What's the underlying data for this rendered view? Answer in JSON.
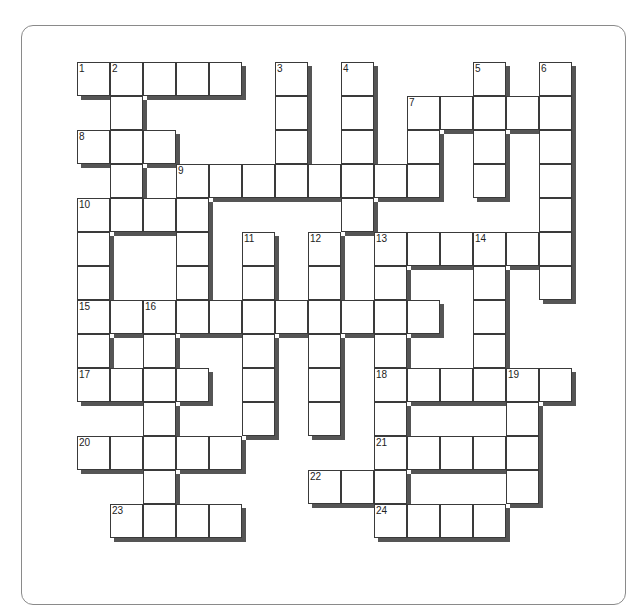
{
  "puzzle": {
    "type": "crossword",
    "cols": 15,
    "rows": 14,
    "origin_x": 77,
    "origin_y": 62,
    "cell_w": 33,
    "cell_h": 34,
    "cells": [
      [
        0,
        0,
        "1"
      ],
      [
        0,
        1,
        "2"
      ],
      [
        0,
        2,
        ""
      ],
      [
        0,
        3,
        ""
      ],
      [
        0,
        4,
        ""
      ],
      [
        0,
        6,
        "3"
      ],
      [
        0,
        8,
        "4"
      ],
      [
        0,
        12,
        "5"
      ],
      [
        0,
        14,
        "6"
      ],
      [
        1,
        1,
        ""
      ],
      [
        1,
        6,
        ""
      ],
      [
        1,
        8,
        ""
      ],
      [
        1,
        10,
        "7"
      ],
      [
        1,
        11,
        ""
      ],
      [
        1,
        12,
        ""
      ],
      [
        1,
        13,
        ""
      ],
      [
        1,
        14,
        ""
      ],
      [
        2,
        0,
        "8"
      ],
      [
        2,
        1,
        ""
      ],
      [
        2,
        2,
        ""
      ],
      [
        2,
        6,
        ""
      ],
      [
        2,
        8,
        ""
      ],
      [
        2,
        10,
        ""
      ],
      [
        2,
        12,
        ""
      ],
      [
        2,
        14,
        ""
      ],
      [
        3,
        1,
        ""
      ],
      [
        3,
        3,
        "9"
      ],
      [
        3,
        4,
        ""
      ],
      [
        3,
        5,
        ""
      ],
      [
        3,
        6,
        ""
      ],
      [
        3,
        7,
        ""
      ],
      [
        3,
        8,
        ""
      ],
      [
        3,
        9,
        ""
      ],
      [
        3,
        10,
        ""
      ],
      [
        3,
        12,
        ""
      ],
      [
        3,
        14,
        ""
      ],
      [
        4,
        0,
        "10"
      ],
      [
        4,
        1,
        ""
      ],
      [
        4,
        2,
        ""
      ],
      [
        4,
        3,
        ""
      ],
      [
        4,
        8,
        ""
      ],
      [
        4,
        14,
        ""
      ],
      [
        5,
        0,
        ""
      ],
      [
        5,
        3,
        ""
      ],
      [
        5,
        5,
        "11"
      ],
      [
        5,
        7,
        "12"
      ],
      [
        5,
        9,
        "13"
      ],
      [
        5,
        10,
        ""
      ],
      [
        5,
        11,
        ""
      ],
      [
        5,
        12,
        "14"
      ],
      [
        5,
        13,
        ""
      ],
      [
        5,
        14,
        ""
      ],
      [
        6,
        0,
        ""
      ],
      [
        6,
        3,
        ""
      ],
      [
        6,
        5,
        ""
      ],
      [
        6,
        7,
        ""
      ],
      [
        6,
        9,
        ""
      ],
      [
        6,
        12,
        ""
      ],
      [
        6,
        14,
        ""
      ],
      [
        7,
        0,
        "15"
      ],
      [
        7,
        1,
        ""
      ],
      [
        7,
        2,
        "16"
      ],
      [
        7,
        3,
        ""
      ],
      [
        7,
        4,
        ""
      ],
      [
        7,
        5,
        ""
      ],
      [
        7,
        6,
        ""
      ],
      [
        7,
        7,
        ""
      ],
      [
        7,
        8,
        ""
      ],
      [
        7,
        9,
        ""
      ],
      [
        7,
        10,
        ""
      ],
      [
        7,
        12,
        ""
      ],
      [
        8,
        0,
        ""
      ],
      [
        8,
        2,
        ""
      ],
      [
        8,
        5,
        ""
      ],
      [
        8,
        7,
        ""
      ],
      [
        8,
        9,
        ""
      ],
      [
        8,
        12,
        ""
      ],
      [
        9,
        0,
        "17"
      ],
      [
        9,
        1,
        ""
      ],
      [
        9,
        2,
        ""
      ],
      [
        9,
        3,
        ""
      ],
      [
        9,
        5,
        ""
      ],
      [
        9,
        7,
        ""
      ],
      [
        9,
        9,
        "18"
      ],
      [
        9,
        10,
        ""
      ],
      [
        9,
        11,
        ""
      ],
      [
        9,
        12,
        ""
      ],
      [
        9,
        13,
        "19"
      ],
      [
        9,
        14,
        ""
      ],
      [
        10,
        2,
        ""
      ],
      [
        10,
        5,
        ""
      ],
      [
        10,
        7,
        ""
      ],
      [
        10,
        9,
        ""
      ],
      [
        10,
        13,
        ""
      ],
      [
        11,
        0,
        "20"
      ],
      [
        11,
        1,
        ""
      ],
      [
        11,
        2,
        ""
      ],
      [
        11,
        3,
        ""
      ],
      [
        11,
        4,
        ""
      ],
      [
        11,
        9,
        "21"
      ],
      [
        11,
        10,
        ""
      ],
      [
        11,
        11,
        ""
      ],
      [
        11,
        12,
        ""
      ],
      [
        11,
        13,
        ""
      ],
      [
        12,
        2,
        ""
      ],
      [
        12,
        7,
        "22"
      ],
      [
        12,
        8,
        ""
      ],
      [
        12,
        9,
        ""
      ],
      [
        12,
        13,
        ""
      ],
      [
        13,
        1,
        "23"
      ],
      [
        13,
        2,
        ""
      ],
      [
        13,
        3,
        ""
      ],
      [
        13,
        4,
        ""
      ],
      [
        13,
        9,
        "24"
      ],
      [
        13,
        10,
        ""
      ],
      [
        13,
        11,
        ""
      ],
      [
        13,
        12,
        ""
      ]
    ],
    "shadow_color": "#555555",
    "border_color": "#3a3a3a"
  }
}
